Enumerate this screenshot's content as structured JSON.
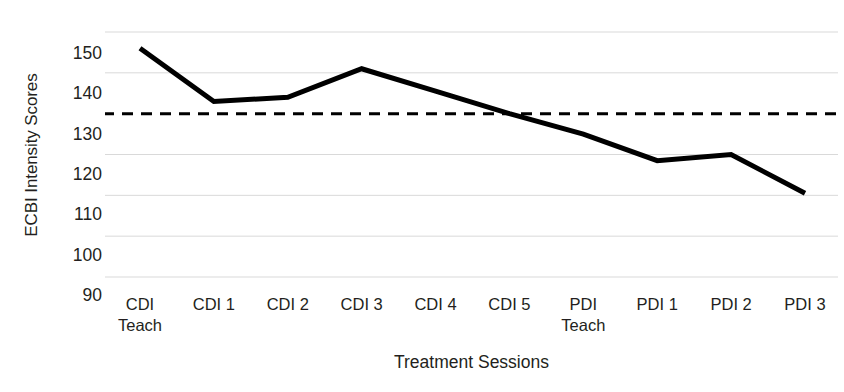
{
  "chart_data": {
    "type": "line",
    "title": "",
    "xlabel": "Treatment Sessions",
    "ylabel": "ECBI Intensity Scores",
    "categories": [
      "CDI Teach",
      "CDI 1",
      "CDI 2",
      "CDI 3",
      "CDI 4",
      "CDI 5",
      "PDI Teach",
      "PDI 1",
      "PDI 2",
      "PDI 3"
    ],
    "category_lines": [
      [
        "CDI",
        "Teach"
      ],
      [
        "CDI 1",
        ""
      ],
      [
        "CDI 2",
        ""
      ],
      [
        "CDI 3",
        ""
      ],
      [
        "CDI 4",
        ""
      ],
      [
        "CDI 5",
        ""
      ],
      [
        "PDI",
        "Teach"
      ],
      [
        "PDI 1",
        ""
      ],
      [
        "PDI 2",
        ""
      ],
      [
        "PDI 3",
        ""
      ]
    ],
    "series": [
      {
        "name": "ECBI Intensity Score",
        "values": [
          146,
          133,
          134,
          141,
          135.5,
          130,
          125,
          118.5,
          120,
          110.5
        ],
        "color": "#000000",
        "line_width": 5
      }
    ],
    "ylim": [
      90,
      150
    ],
    "yticks": [
      90,
      100,
      110,
      120,
      130,
      140,
      150
    ],
    "ytick_labels": [
      "90",
      "100",
      "110",
      "120",
      "130",
      "140",
      "150"
    ],
    "grid": true,
    "grid_color": "#d9d9d9",
    "legend": "none",
    "reference_line": {
      "name": "clinical-cutoff",
      "value": 130,
      "style": "dashed",
      "color": "#000000",
      "line_width": 3
    }
  }
}
